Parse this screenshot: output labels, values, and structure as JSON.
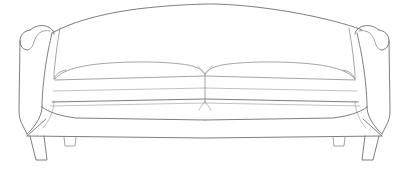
{
  "artwork": {
    "title": "Sofa line drawing",
    "subject": "three-seat sofa with rolled arms",
    "style": "outline illustration",
    "view": "front elevation",
    "background_color": "#ffffff",
    "line_color": "#6e6e72",
    "canvas": {
      "width": 413,
      "height": 173
    }
  },
  "parts": {
    "back": {
      "label": "curved sofa back"
    },
    "left_arm": {
      "label": "left rolled arm"
    },
    "right_arm": {
      "label": "right rolled arm"
    },
    "left_cushion": {
      "label": "left seat cushion"
    },
    "right_cushion": {
      "label": "right seat cushion"
    },
    "center_seam": {
      "label": "center cushion seam"
    },
    "base": {
      "label": "sofa base skirt"
    },
    "left_leg": {
      "label": "left front leg"
    },
    "right_leg": {
      "label": "right front leg"
    },
    "left_mid_leg": {
      "label": "left middle leg"
    },
    "right_mid_leg": {
      "label": "right middle leg"
    }
  }
}
